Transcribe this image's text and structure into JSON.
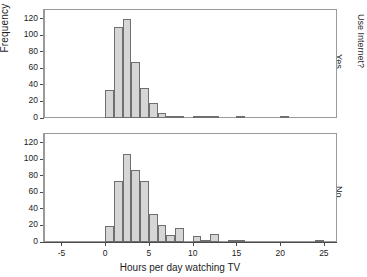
{
  "chart_data": {
    "type": "bar",
    "title": "",
    "xlabel": "Hours per day watching TV",
    "ylabel": "Frequency",
    "panel_variable": "Use Internet?",
    "xlim": [
      -7,
      26.5
    ],
    "ylim": [
      0,
      132
    ],
    "grid": false,
    "legend": "none",
    "xticks": [
      "-5",
      "0",
      "5",
      "10",
      "15",
      "20",
      "25"
    ],
    "xtick_values": [
      -5,
      0,
      5,
      10,
      15,
      20,
      25
    ],
    "yticks": [
      "0",
      "20",
      "40",
      "60",
      "80",
      "100",
      "120"
    ],
    "ytick_values": [
      0,
      20,
      40,
      60,
      80,
      100,
      120
    ],
    "bin_width": 1,
    "panels": [
      {
        "label": "Yes",
        "position": "top",
        "bin_starts": [
          0,
          1,
          2,
          3,
          4,
          5,
          6,
          7,
          8,
          10,
          11,
          12,
          15,
          20
        ],
        "values": [
          34,
          110,
          120,
          68,
          36,
          18,
          6,
          2,
          3,
          3,
          3,
          1,
          1,
          1
        ]
      },
      {
        "label": "No",
        "position": "bottom",
        "bin_starts": [
          0,
          1,
          2,
          3,
          4,
          5,
          6,
          7,
          8,
          10,
          11,
          12,
          14,
          15,
          24
        ],
        "values": [
          19,
          74,
          107,
          87,
          74,
          34,
          21,
          8,
          17,
          7,
          1,
          10,
          2,
          1,
          1
        ]
      }
    ],
    "colors": {
      "bar_fill": "#d6d6d6",
      "bar_edge": "#6f6f6f",
      "axis": "#4a4a4a",
      "frame": "#9a9a9a",
      "text": "#1d1d1d"
    }
  }
}
